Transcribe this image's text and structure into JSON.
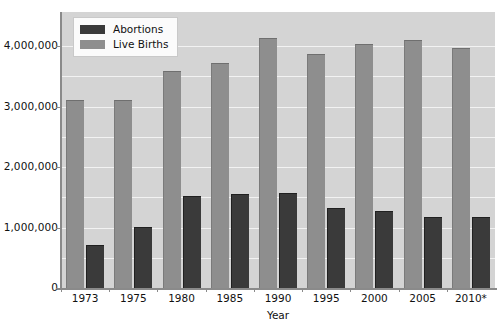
{
  "chart_data": {
    "type": "bar",
    "title": "",
    "xlabel": "Year",
    "ylabel": "",
    "categories": [
      "1973",
      "1975",
      "1980",
      "1985",
      "1990",
      "1995",
      "2000",
      "2005",
      "2010*"
    ],
    "series": [
      {
        "name": "Abortions",
        "color": "#3a3a3a",
        "values": [
          744600,
          1034200,
          1553900,
          1588600,
          1609000,
          1363700,
          1313000,
          1206200,
          1212400
        ]
      },
      {
        "name": "Live Births",
        "color": "#8e8e8e",
        "values": [
          3136965,
          3144198,
          3612258,
          3760561,
          4158212,
          3899589,
          4058814,
          4138349,
          3999386
        ]
      }
    ],
    "ylim": [
      0,
      4500000
    ],
    "y_ticks": [
      0,
      1000000,
      2000000,
      3000000,
      4000000
    ],
    "y_tick_labels": [
      "0",
      "1,000,000",
      "2,000,000",
      "3,000,000",
      "4,000,000"
    ],
    "gridlines": [
      500000,
      1000000,
      1500000,
      2000000,
      2500000,
      3000000,
      3500000,
      4000000
    ],
    "grid": true,
    "legend_position": "top-left",
    "plot_background": "#d4d4d4",
    "grid_color": "#f2f2f2",
    "axis_color": "#8a8a8a",
    "figure_background": "#ffffff"
  },
  "legend": {
    "items": [
      {
        "label": "Abortions",
        "swatch": "abortions-swatch"
      },
      {
        "label": "Live Births",
        "swatch": "live-births-swatch"
      }
    ]
  },
  "axes": {
    "x_title": "Year"
  }
}
